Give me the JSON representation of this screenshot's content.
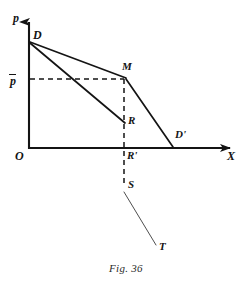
{
  "figure": {
    "caption": "Fig. 36",
    "type": "line-diagram",
    "ink_color": "#141414",
    "background_color": "#ffffff"
  },
  "axes": {
    "vertical": {
      "label": "p",
      "label_style": "italic",
      "origin_px": [
        29,
        148
      ],
      "tip_px": [
        29,
        14
      ],
      "arrowhead": true
    },
    "horizontal": {
      "label": "X",
      "label_style": "italic",
      "origin_px": [
        29,
        148
      ],
      "tip_px": [
        238,
        148
      ],
      "arrowhead": true
    },
    "origin": {
      "label": "O"
    }
  },
  "points": [
    {
      "id": "D",
      "label": "D",
      "x_px": 29,
      "y_px": 42,
      "label_x": 32,
      "label_y": 30,
      "on_axis": "p"
    },
    {
      "id": "P_BAR",
      "label": "p",
      "overbar": true,
      "x_px": 29,
      "y_px": 79,
      "label_x": 9,
      "label_y": 72,
      "on_axis": "p"
    },
    {
      "id": "M",
      "label": "M",
      "x_px": 124,
      "y_px": 79,
      "label_x": 122,
      "label_y": 63,
      "on_axis": "none"
    },
    {
      "id": "R",
      "label": "R",
      "x_px": 124,
      "y_px": 122,
      "label_x": 127,
      "label_y": 116,
      "on_axis": "none"
    },
    {
      "id": "R_PRIME",
      "label": "R'",
      "x_px": 124,
      "y_px": 148,
      "label_x": 127,
      "label_y": 150,
      "on_axis": "X"
    },
    {
      "id": "D_PRIME",
      "label": "D'",
      "x_px": 172,
      "y_px": 148,
      "label_x": 176,
      "label_y": 131,
      "on_axis": "X"
    },
    {
      "id": "S",
      "label": "S",
      "x_px": 124,
      "y_px": 185,
      "label_x": 127,
      "label_y": 180,
      "on_axis": "none"
    },
    {
      "id": "T",
      "label": "T",
      "x_px": 155,
      "y_px": 245,
      "label_x": 159,
      "label_y": 242,
      "on_axis": "none"
    }
  ],
  "segments": [
    {
      "id": "D-to-M",
      "from": "D",
      "to": "M",
      "style": "solid",
      "weight": "medium"
    },
    {
      "id": "M-to-Dprime",
      "from": "M",
      "to": "D_PRIME",
      "style": "solid",
      "weight": "medium"
    },
    {
      "id": "D-to-R",
      "from": "D",
      "to": "R",
      "style": "solid",
      "weight": "medium"
    },
    {
      "id": "pbar-to-M",
      "from": "P_BAR",
      "to": "M",
      "style": "dashed",
      "weight": "thin"
    },
    {
      "id": "M-to-S",
      "from": "M",
      "to": "S",
      "style": "dashed",
      "weight": "thin"
    },
    {
      "id": "S-to-T",
      "from": "S",
      "to": "T",
      "style": "solid",
      "weight": "hairline"
    }
  ],
  "labels": {
    "p_axis": "p",
    "x_axis": "X",
    "origin": "O",
    "p_bar": "p",
    "D": "D",
    "M": "M",
    "R": "R",
    "R_prime": "R'",
    "D_prime": "D'",
    "S": "S",
    "T": "T"
  }
}
